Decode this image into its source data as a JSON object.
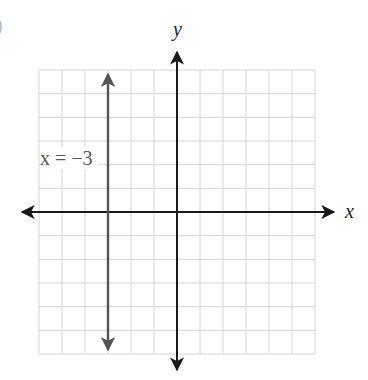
{
  "figure": {
    "corner_mark": ")",
    "x_axis_label": "x",
    "y_axis_label": "y",
    "line_label": "x = −3"
  },
  "colors": {
    "grid": "#d4d4d4",
    "axes": "#1a1a1a",
    "line": "#555555",
    "background": "#ffffff"
  },
  "chart_data": {
    "type": "line",
    "title": "",
    "xlabel": "x",
    "ylabel": "y",
    "xlim": [
      -6,
      6
    ],
    "ylim": [
      -6,
      6
    ],
    "grid": true,
    "grid_step": 1,
    "tick_labels": false,
    "legend": null,
    "series": [
      {
        "name": "x = −3",
        "kind": "vertical-line",
        "x": [
          -3,
          -3
        ],
        "y": [
          -6,
          6
        ],
        "arrows": "both",
        "label": "x = −3",
        "label_position": [
          -5.5,
          2
        ]
      }
    ],
    "annotations": [
      {
        "text": "x = −3",
        "x": -5.5,
        "y": 2
      }
    ]
  }
}
